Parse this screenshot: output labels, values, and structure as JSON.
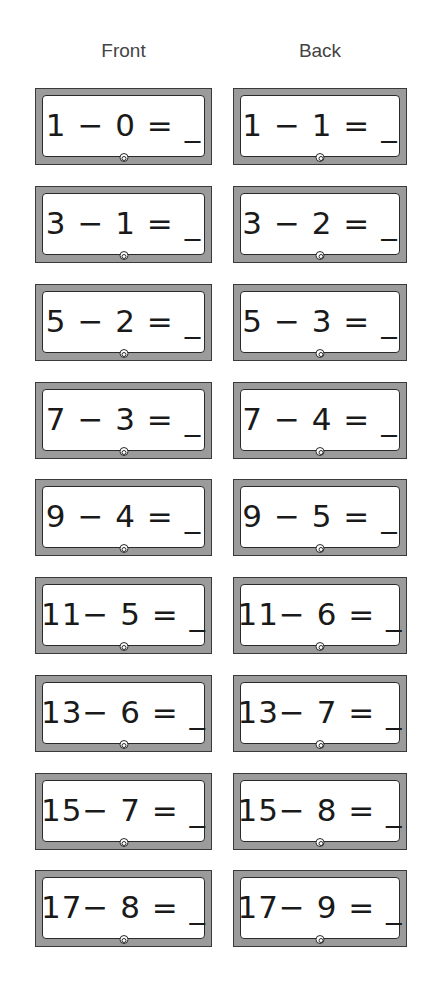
{
  "headers": {
    "front": "Front",
    "back": "Back"
  },
  "cards": [
    {
      "front": "1 − 0 = _",
      "back": "1 − 1 = _"
    },
    {
      "front": "3 − 1 = _",
      "back": "3 − 2 = _"
    },
    {
      "front": "5 − 2 = _",
      "back": "5 − 3 = _"
    },
    {
      "front": "7 − 3 = _",
      "back": "7 − 4 = _"
    },
    {
      "front": "9 − 4 = _",
      "back": "9 − 5 = _"
    },
    {
      "front": "11− 5 = _",
      "back": "11− 6 = _"
    },
    {
      "front": "13− 6 = _",
      "back": "13− 7 = _"
    },
    {
      "front": "15− 7 = _",
      "back": "15− 8 = _"
    },
    {
      "front": "17− 8 = _",
      "back": "17− 9 = _"
    }
  ],
  "colors": {
    "frame": "#9b9b9b",
    "border": "#2a2a2a",
    "text": "#1a1a1a"
  }
}
